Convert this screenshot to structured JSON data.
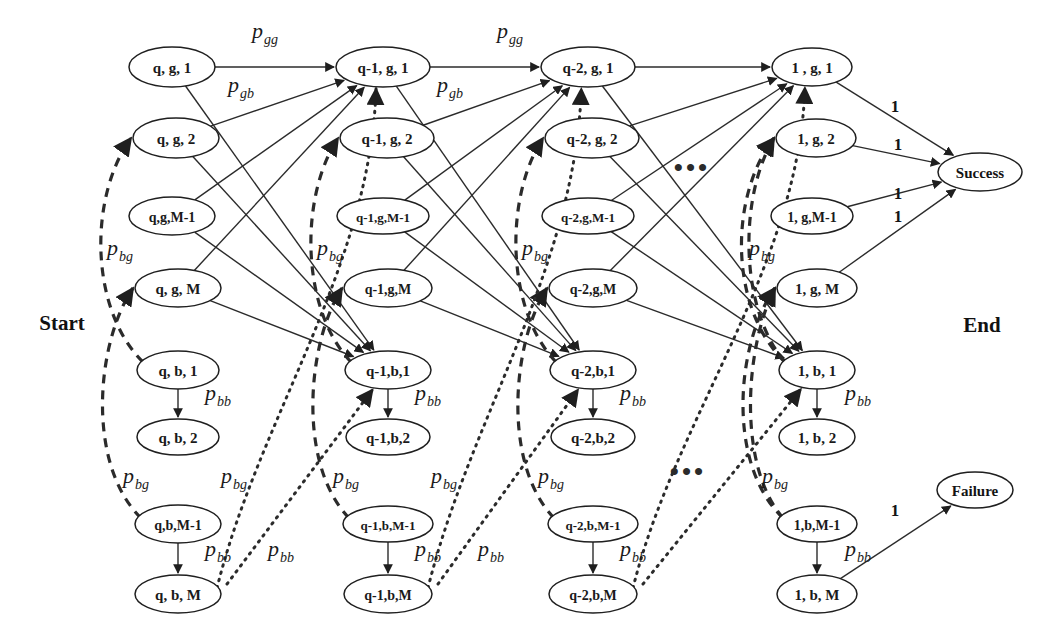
{
  "figure": {
    "type": "markov-chain-state-transition-diagram",
    "background": "#ffffff",
    "stroke_color": "#2b2b2b",
    "start_label": "Start",
    "end_label": "End",
    "ellipsis_top": "•••",
    "ellipsis_bottom": "•••"
  },
  "columns": [
    {
      "id": "col-q",
      "prefix": "q",
      "x": 172,
      "nodes": [
        {
          "id": "q-g-1",
          "label": "q, g, 1",
          "x": 172,
          "y": 67,
          "rx": 43,
          "ry": 20,
          "fontsize": 15
        },
        {
          "id": "q-g-2",
          "label": "q, g, 2",
          "x": 176,
          "y": 138,
          "rx": 43,
          "ry": 20,
          "fontsize": 15
        },
        {
          "id": "q-g-M1",
          "label": "q,g,M-1",
          "x": 172,
          "y": 216,
          "rx": 43,
          "ry": 19,
          "fontsize": 14
        },
        {
          "id": "q-g-M",
          "label": "q, g, M",
          "x": 178,
          "y": 288,
          "rx": 43,
          "ry": 19,
          "fontsize": 15
        },
        {
          "id": "q-b-1",
          "label": "q, b, 1",
          "x": 178,
          "y": 370,
          "rx": 41,
          "ry": 19,
          "fontsize": 15
        },
        {
          "id": "q-b-2",
          "label": "q, b, 2",
          "x": 178,
          "y": 437,
          "rx": 41,
          "ry": 18,
          "fontsize": 15
        },
        {
          "id": "q-b-M1",
          "label": "q,b,M-1",
          "x": 178,
          "y": 524,
          "rx": 43,
          "ry": 19,
          "fontsize": 14
        },
        {
          "id": "q-b-M",
          "label": "q, b, M",
          "x": 178,
          "y": 594,
          "rx": 43,
          "ry": 19,
          "fontsize": 15
        }
      ]
    },
    {
      "id": "col-q1",
      "prefix": "q-1",
      "x": 383,
      "nodes": [
        {
          "id": "q1-g-1",
          "label": "q-1, g, 1",
          "x": 383,
          "y": 67,
          "rx": 47,
          "ry": 20,
          "fontsize": 15
        },
        {
          "id": "q1-g-2",
          "label": "q-1, g, 2",
          "x": 387,
          "y": 138,
          "rx": 47,
          "ry": 20,
          "fontsize": 15
        },
        {
          "id": "q1-g-M1",
          "label": "q-1,g,M-1",
          "x": 383,
          "y": 216,
          "rx": 46,
          "ry": 18,
          "fontsize": 13
        },
        {
          "id": "q1-g-M",
          "label": "q-1,g,M",
          "x": 388,
          "y": 288,
          "rx": 44,
          "ry": 19,
          "fontsize": 14
        },
        {
          "id": "q1-b-1",
          "label": "q-1,b,1",
          "x": 388,
          "y": 370,
          "rx": 43,
          "ry": 19,
          "fontsize": 15
        },
        {
          "id": "q1-b-2",
          "label": "q-1,b,2",
          "x": 388,
          "y": 437,
          "rx": 42,
          "ry": 18,
          "fontsize": 15
        },
        {
          "id": "q1-b-M1",
          "label": "q-1,b,M-1",
          "x": 388,
          "y": 524,
          "rx": 45,
          "ry": 18,
          "fontsize": 13
        },
        {
          "id": "q1-b-M",
          "label": "q-1,b,M",
          "x": 388,
          "y": 594,
          "rx": 44,
          "ry": 19,
          "fontsize": 14
        }
      ]
    },
    {
      "id": "col-q2",
      "prefix": "q-2",
      "x": 588,
      "nodes": [
        {
          "id": "q2-g-1",
          "label": "q-2, g, 1",
          "x": 588,
          "y": 67,
          "rx": 47,
          "ry": 20,
          "fontsize": 15
        },
        {
          "id": "q2-g-2",
          "label": "q-2, g, 2",
          "x": 592,
          "y": 138,
          "rx": 47,
          "ry": 20,
          "fontsize": 15
        },
        {
          "id": "q2-g-M1",
          "label": "q-2,g,M-1",
          "x": 588,
          "y": 216,
          "rx": 46,
          "ry": 18,
          "fontsize": 13
        },
        {
          "id": "q2-g-M",
          "label": "q-2,g,M",
          "x": 593,
          "y": 288,
          "rx": 44,
          "ry": 19,
          "fontsize": 14
        },
        {
          "id": "q2-b-1",
          "label": "q-2,b,1",
          "x": 593,
          "y": 370,
          "rx": 43,
          "ry": 19,
          "fontsize": 15
        },
        {
          "id": "q2-b-2",
          "label": "q-2,b,2",
          "x": 593,
          "y": 437,
          "rx": 42,
          "ry": 18,
          "fontsize": 15
        },
        {
          "id": "q2-b-M1",
          "label": "q-2,b,M-1",
          "x": 593,
          "y": 524,
          "rx": 45,
          "ry": 18,
          "fontsize": 13
        },
        {
          "id": "q2-b-M",
          "label": "q-2,b,M",
          "x": 593,
          "y": 594,
          "rx": 44,
          "ry": 19,
          "fontsize": 14
        }
      ]
    },
    {
      "id": "col-1",
      "prefix": "1",
      "x": 812,
      "nodes": [
        {
          "id": "o-g-1",
          "label": "1 , g, 1",
          "x": 812,
          "y": 67,
          "rx": 40,
          "ry": 19,
          "fontsize": 15
        },
        {
          "id": "o-g-2",
          "label": "1, g, 2",
          "x": 816,
          "y": 138,
          "rx": 40,
          "ry": 19,
          "fontsize": 15
        },
        {
          "id": "o-g-M1",
          "label": "1, g,M-1",
          "x": 812,
          "y": 216,
          "rx": 41,
          "ry": 18,
          "fontsize": 14
        },
        {
          "id": "o-g-M",
          "label": "1, g, M",
          "x": 817,
          "y": 288,
          "rx": 40,
          "ry": 19,
          "fontsize": 15
        },
        {
          "id": "o-b-1",
          "label": "1, b, 1",
          "x": 817,
          "y": 370,
          "rx": 38,
          "ry": 19,
          "fontsize": 15
        },
        {
          "id": "o-b-2",
          "label": "1, b, 2",
          "x": 817,
          "y": 437,
          "rx": 38,
          "ry": 18,
          "fontsize": 15
        },
        {
          "id": "o-b-M1",
          "label": "1,b,M-1",
          "x": 817,
          "y": 524,
          "rx": 40,
          "ry": 18,
          "fontsize": 14
        },
        {
          "id": "o-b-M",
          "label": "1, b, M",
          "x": 817,
          "y": 594,
          "rx": 40,
          "ry": 19,
          "fontsize": 15
        }
      ]
    }
  ],
  "terminals": [
    {
      "id": "success",
      "label": "Success",
      "x": 980,
      "y": 172,
      "rx": 42,
      "ry": 19
    },
    {
      "id": "failure",
      "label": "Failure",
      "x": 975,
      "y": 490,
      "rx": 38,
      "ry": 18
    }
  ],
  "probability_labels": [
    {
      "id": "pgg-1",
      "base": "p",
      "sub": "gg",
      "x": 252,
      "y": 38
    },
    {
      "id": "pgg-2",
      "base": "p",
      "sub": "gg",
      "x": 497,
      "y": 38
    },
    {
      "id": "pgb-1",
      "base": "p",
      "sub": "gb",
      "x": 228,
      "y": 92
    },
    {
      "id": "pgb-2",
      "base": "p",
      "sub": "gb",
      "x": 437,
      "y": 92
    },
    {
      "id": "pbg-c0",
      "base": "p",
      "sub": "bg",
      "x": 107,
      "y": 255
    },
    {
      "id": "pbg-c1",
      "base": "p",
      "sub": "bg",
      "x": 317,
      "y": 255
    },
    {
      "id": "pbg-c2",
      "base": "p",
      "sub": "bg",
      "x": 522,
      "y": 255
    },
    {
      "id": "pbg-c3",
      "base": "p",
      "sub": "bg",
      "x": 749,
      "y": 255
    },
    {
      "id": "pbb-q1",
      "base": "p",
      "sub": "bb",
      "x": 205,
      "y": 400
    },
    {
      "id": "pbb-q2",
      "base": "p",
      "sub": "bb",
      "x": 415,
      "y": 400
    },
    {
      "id": "pbb-q3",
      "base": "p",
      "sub": "bb",
      "x": 620,
      "y": 400
    },
    {
      "id": "pbb-q4",
      "base": "p",
      "sub": "bb",
      "x": 845,
      "y": 400
    },
    {
      "id": "pbg-l0",
      "base": "p",
      "sub": "bg",
      "x": 123,
      "y": 483
    },
    {
      "id": "pbg-d0",
      "base": "p",
      "sub": "bg",
      "x": 221,
      "y": 483
    },
    {
      "id": "pbg-l1",
      "base": "p",
      "sub": "bg",
      "x": 333,
      "y": 483
    },
    {
      "id": "pbg-d1",
      "base": "p",
      "sub": "bg",
      "x": 431,
      "y": 483
    },
    {
      "id": "pbg-l2",
      "base": "p",
      "sub": "bg",
      "x": 538,
      "y": 483
    },
    {
      "id": "pbg-l3",
      "base": "p",
      "sub": "bg",
      "x": 762,
      "y": 483
    },
    {
      "id": "pbb-m0",
      "base": "p",
      "sub": "bb",
      "x": 205,
      "y": 556
    },
    {
      "id": "pbb-x0",
      "base": "p",
      "sub": "bb",
      "x": 268,
      "y": 556
    },
    {
      "id": "pbb-m1",
      "base": "p",
      "sub": "bb",
      "x": 415,
      "y": 556
    },
    {
      "id": "pbb-x1",
      "base": "p",
      "sub": "bb",
      "x": 478,
      "y": 556
    },
    {
      "id": "pbb-m2",
      "base": "p",
      "sub": "bb",
      "x": 620,
      "y": 556
    },
    {
      "id": "pbb-m3",
      "base": "p",
      "sub": "bb",
      "x": 845,
      "y": 556
    }
  ],
  "weight_labels": [
    {
      "id": "w-s1",
      "text": "1",
      "x": 895,
      "y": 112
    },
    {
      "id": "w-s2",
      "text": "1",
      "x": 898,
      "y": 150
    },
    {
      "id": "w-s3",
      "text": "1",
      "x": 898,
      "y": 199
    },
    {
      "id": "w-s4",
      "text": "1",
      "x": 898,
      "y": 222
    },
    {
      "id": "w-f1",
      "text": "1",
      "x": 895,
      "y": 516
    }
  ],
  "markers": {
    "start_x": 62,
    "start_y": 323,
    "end_x": 982,
    "end_y": 325,
    "dots_top_x": 692,
    "dots_top_y": 176,
    "dots_bottom_x": 688,
    "dots_bottom_y": 480
  },
  "edge_types": {
    "gg": "solid",
    "gb": "solid",
    "bb": "solid-vertical",
    "bg_dashed": "dashed",
    "bg_dotted": "dotted",
    "terminal": "solid"
  }
}
